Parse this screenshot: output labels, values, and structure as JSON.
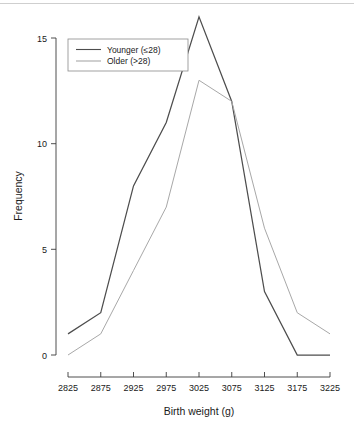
{
  "chart_data": {
    "type": "line",
    "title": "",
    "subtitle": "",
    "xlabel": "Birth weight (g)",
    "ylabel": "Frequency",
    "categories": [
      "2825",
      "2875",
      "2925",
      "2975",
      "3025",
      "3075",
      "3125",
      "3175",
      "3225"
    ],
    "x": [
      2825,
      2875,
      2925,
      2975,
      3025,
      3075,
      3125,
      3175,
      3225
    ],
    "series": [
      {
        "name": "Younger (≤28)",
        "values": [
          1,
          2,
          8,
          11,
          16,
          12,
          3,
          0,
          0
        ],
        "color": "#4d4d4d"
      },
      {
        "name": "Older (>28)",
        "values": [
          0,
          1,
          4,
          7,
          13,
          12,
          6,
          2,
          1
        ],
        "color": "#a8a8a8"
      }
    ],
    "xlim": [
      2825,
      3225
    ],
    "ylim": [
      0,
      16
    ],
    "xticks": [
      2825,
      2875,
      2925,
      2975,
      3025,
      3075,
      3125,
      3175,
      3225
    ],
    "yticks": [
      0,
      5,
      10,
      15
    ],
    "ytick_labels": [
      "0",
      "5",
      "10",
      "15"
    ],
    "grid": false,
    "legend_position": "top-left",
    "legend_entries": [
      "Younger (≤28)",
      "Older (>28)"
    ]
  },
  "axes": {
    "y_title": "Frequency",
    "x_title": "Birth weight (g)"
  },
  "legend": {
    "items": [
      {
        "label": "Younger (≤28)"
      },
      {
        "label": "Older (>28)"
      }
    ]
  },
  "colors": {
    "younger": "#4d4d4d",
    "older": "#a8a8a8",
    "axis": "#3b3b3b",
    "text": "#1a1a1a",
    "background": "#ffffff"
  }
}
